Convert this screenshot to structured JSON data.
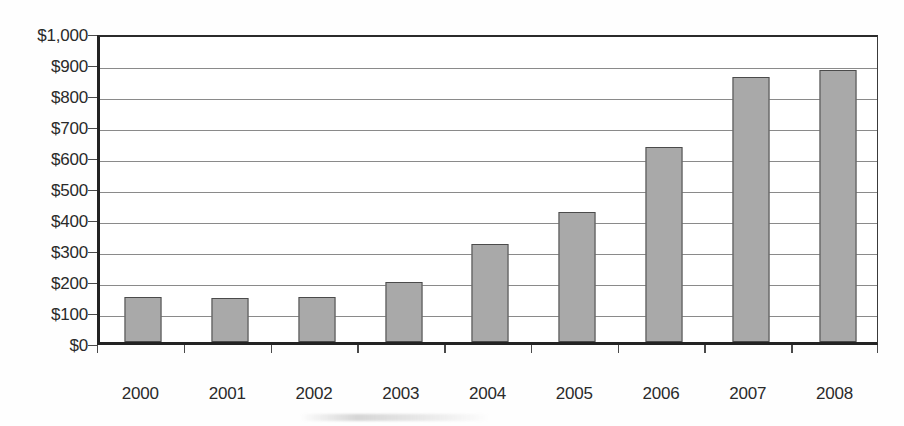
{
  "chart_data": {
    "type": "bar",
    "title": "",
    "subtitle": "",
    "xlabel": "",
    "ylabel": "",
    "categories": [
      "2000",
      "2001",
      "2002",
      "2003",
      "2004",
      "2005",
      "2006",
      "2007",
      "2008"
    ],
    "values": [
      145,
      143,
      145,
      195,
      315,
      420,
      630,
      855,
      878
    ],
    "series": [
      {
        "name": "",
        "values": [
          145,
          143,
          145,
          195,
          315,
          420,
          630,
          855,
          878
        ]
      }
    ],
    "ylim": [
      0,
      1000
    ],
    "ytick_step": 100,
    "ytick_values": [
      0,
      100,
      200,
      300,
      400,
      500,
      600,
      700,
      800,
      900,
      1000
    ],
    "ytick_labels": [
      "$0",
      "$100",
      "$200",
      "$300",
      "$400",
      "$500",
      "$600",
      "$700",
      "$800",
      "$900",
      "$1,000"
    ],
    "xtick_labels": [
      "2000",
      "2001",
      "2002",
      "2003",
      "2004",
      "2005",
      "2006",
      "2007",
      "2008"
    ],
    "value_prefix": "$",
    "grid": true,
    "grid_axis": "y",
    "legend": false,
    "legend_position": "none",
    "annotations": [],
    "colors": {
      "bar_fill": "#a9a9a9",
      "bar_border": "#4b4b4b",
      "gridline": "#8a8a8a",
      "axis": "#232323",
      "text": "#2a2a2a",
      "background": "#ffffff"
    }
  }
}
